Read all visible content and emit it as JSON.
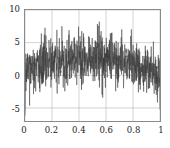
{
  "figure": {
    "background_color": "#ffffff",
    "frame_color": "#8a8a8a",
    "grid_color": "#b4b4b4",
    "signal_color": "#3a3a3a",
    "tick_text_color": "#1a1a1a"
  },
  "chart_data": {
    "type": "line",
    "title": "",
    "subtitle": "",
    "xlabel": "",
    "ylabel": "",
    "xlim": [
      0,
      1
    ],
    "ylim": [
      -7,
      10
    ],
    "xticks": [
      0,
      0.2,
      0.4,
      0.6,
      0.8,
      1
    ],
    "xtick_labels": [
      "0",
      "0.2",
      "0.4",
      "0.6",
      "0.8",
      "1"
    ],
    "yticks": [
      -5,
      0,
      5,
      10
    ],
    "ytick_labels": [
      "-5",
      "0",
      "5",
      "10"
    ],
    "grid": true,
    "grid_axes": "both",
    "legend": null,
    "legend_position": "none",
    "series": [
      {
        "name": "noisy signal",
        "color": "#3a3a3a",
        "linewidth": 0.5,
        "description": "Dense high-frequency random noise with an arch-shaped (bell) mean envelope: baseline near 0 at x=0 and x=1, peaking near mean 2.5 around x=0.45-0.55. Noise amplitude roughly constant (sd about 1.8), positive spikes up to about 9 and negative spikes down to about -6.",
        "envelope_mean": {
          "x": [
            0.0,
            0.05,
            0.1,
            0.15,
            0.2,
            0.25,
            0.3,
            0.35,
            0.4,
            0.45,
            0.5,
            0.55,
            0.6,
            0.65,
            0.7,
            0.75,
            0.8,
            0.85,
            0.9,
            0.95,
            1.0
          ],
          "y": [
            0.2,
            0.8,
            1.3,
            1.7,
            2.0,
            2.2,
            2.35,
            2.45,
            2.5,
            2.55,
            2.55,
            2.5,
            2.45,
            2.35,
            2.2,
            2.0,
            1.75,
            1.4,
            1.0,
            0.6,
            0.2
          ]
        },
        "upper_envelope": {
          "x": [
            0.0,
            0.1,
            0.2,
            0.3,
            0.4,
            0.5,
            0.6,
            0.7,
            0.8,
            0.9,
            1.0
          ],
          "y": [
            6.5,
            6.2,
            7.3,
            8.6,
            8.9,
            7.6,
            7.2,
            7.1,
            8.4,
            7.0,
            6.0
          ]
        },
        "lower_envelope": {
          "x": [
            0.0,
            0.1,
            0.2,
            0.3,
            0.4,
            0.5,
            0.6,
            0.7,
            0.8,
            0.9,
            1.0
          ],
          "y": [
            -6.2,
            -4.0,
            -3.4,
            -3.1,
            -2.6,
            -3.0,
            -3.2,
            -3.8,
            -2.9,
            -4.1,
            -5.8
          ]
        },
        "stats": {
          "n_points": 1000,
          "min": -6.2,
          "max": 8.9,
          "noise_sd": 1.8
        }
      }
    ]
  },
  "caption_fragment": " "
}
